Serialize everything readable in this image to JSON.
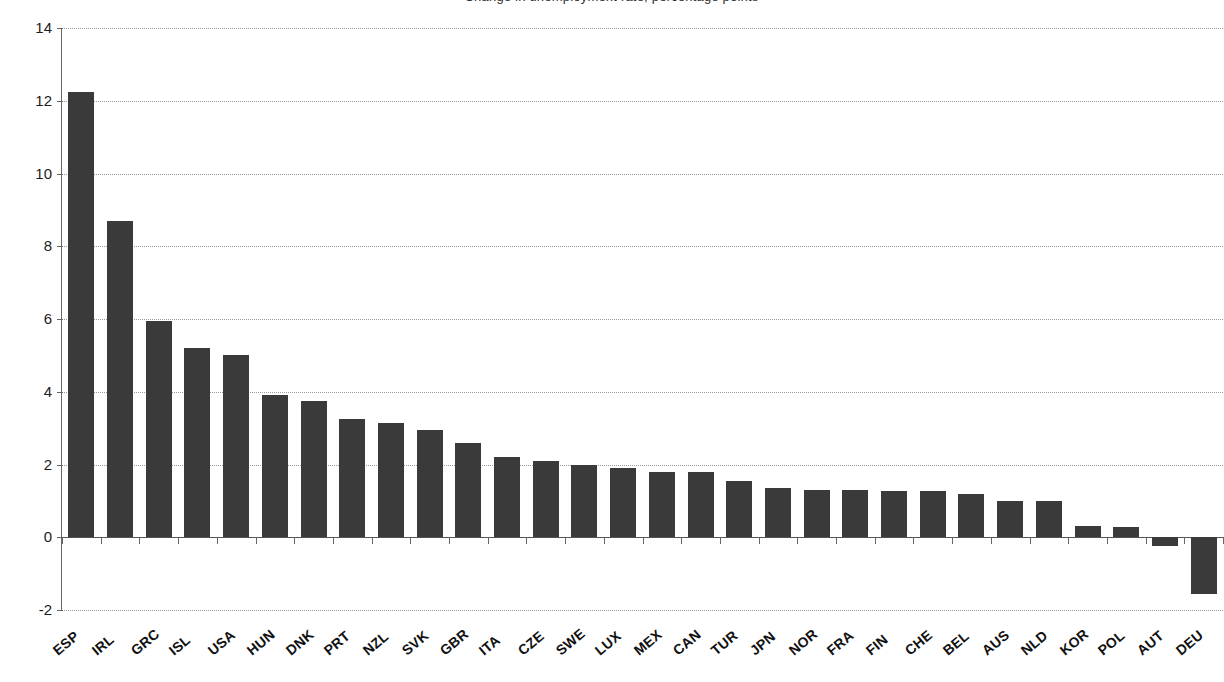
{
  "chart_data": {
    "type": "bar",
    "title": "Change in unemployment rate, percentage points",
    "xlabel": "",
    "ylabel": "",
    "ylim": [
      -2,
      14
    ],
    "yticks": [
      -2,
      0,
      2,
      4,
      6,
      8,
      10,
      12,
      14
    ],
    "ytick_labels": [
      "-2",
      "0",
      "2",
      "4",
      "6",
      "8",
      "10",
      "12",
      "14"
    ],
    "grid": true,
    "legend": "none",
    "bar_color": "#3a3a3a",
    "categories": [
      "ESP",
      "IRL",
      "GRC",
      "ISL",
      "USA",
      "HUN",
      "DNK",
      "PRT",
      "NZL",
      "SVK",
      "GBR",
      "ITA",
      "CZE",
      "SWE",
      "LUX",
      "MEX",
      "CAN",
      "TUR",
      "JPN",
      "NOR",
      "FRA",
      "FIN",
      "CHE",
      "BEL",
      "AUS",
      "NLD",
      "KOR",
      "POL",
      "AUT",
      "DEU"
    ],
    "values": [
      12.25,
      8.7,
      5.95,
      5.2,
      5.0,
      3.9,
      3.75,
      3.25,
      3.15,
      2.95,
      2.6,
      2.2,
      2.1,
      2.0,
      1.9,
      1.8,
      1.8,
      1.55,
      1.35,
      1.3,
      1.3,
      1.27,
      1.27,
      1.2,
      1.0,
      1.0,
      0.3,
      0.27,
      -0.25,
      -1.55
    ]
  }
}
